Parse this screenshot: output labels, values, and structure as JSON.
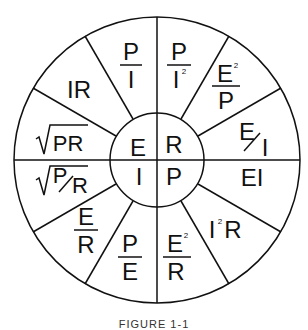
{
  "wheel": {
    "title": "Ohm's Law / Power Wheel",
    "center": {
      "E": "E",
      "R": "R",
      "I": "I",
      "P": "P"
    },
    "segments": {
      "e_pi_num": "P",
      "e_pi_den": "I",
      "e_ir": "IR",
      "e_sqrt": "PR",
      "i_sqrt_num": "P",
      "i_sqrt_den": "R",
      "i_er_num": "E",
      "i_er_den": "R",
      "i_pe_num": "P",
      "i_pe_den": "E",
      "p_e2r_num": "E",
      "p_e2r_den": "R",
      "p_e2r_exp": "2",
      "p_i2r_base": "I",
      "p_i2r_exp": "2",
      "p_i2r_tail": "R",
      "p_ei": "EI",
      "r_ei_num": "E",
      "r_ei_den": "I",
      "r_e2p_num": "E",
      "r_e2p_den": "P",
      "r_e2p_exp": "2",
      "r_pi2_num": "P",
      "r_pi2_den": "I",
      "r_pi2_exp": "2"
    }
  },
  "caption": "FIGURE 1-1"
}
